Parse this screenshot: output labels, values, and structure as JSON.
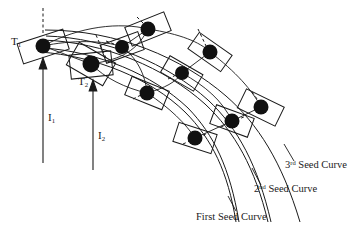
{
  "figure": {
    "name": "seed-curve-sampling-diagram",
    "background_color": "#ffffff",
    "stroke_color": "#1a1a1a",
    "dot_color": "#111111",
    "width": 361,
    "height": 232
  },
  "labels": {
    "t1": {
      "base": "T",
      "sub": "1"
    },
    "t2": {
      "base": "T",
      "sub": "2"
    },
    "i1": {
      "base": "I",
      "sub": "1"
    },
    "i2": {
      "base": "I",
      "sub": "2"
    },
    "curve3": {
      "num": "3",
      "ord": "rd",
      "text": " Seed Curve"
    },
    "curve2": {
      "num": "2",
      "ord": "nd",
      "text": " Seed Curve"
    },
    "curve1": {
      "text": "First Seed Curve"
    }
  },
  "diagram_data": {
    "type": "technical-diagram",
    "description": "Three nested seed curves with oriented rectangular sample boxes and solid sample dots, dashed tangent directions, and two upward direction arrows I1 and I2 pointing at sample points T1 and T2.",
    "seed_curves": [
      {
        "name": "First Seed Curve",
        "path": "M 40 52 C 95 56 150 78 185 112 C 212 139 228 172 236 222"
      },
      {
        "name": "2nd Seed Curve",
        "path": "M 42 40 C 105 42 165 68 205 104 C 235 132 255 168 268 222"
      },
      {
        "name": "3rd Seed Curve",
        "path": "M 45 30 C 118 30 182 58 226 96 C 258 124 282 162 300 222"
      }
    ],
    "sample_points": [
      {
        "id": "p1",
        "label": "T1",
        "cx": 43,
        "cy": 46,
        "r": 7.5,
        "box_angle": -18
      },
      {
        "id": "p2",
        "label": "T2",
        "cx": 91,
        "cy": 64,
        "r": 8.5,
        "box_angle": 30
      },
      {
        "id": "p3",
        "label": "",
        "cx": 148,
        "cy": 29,
        "r": 7.5,
        "box_angle": -22
      },
      {
        "id": "p4",
        "label": "",
        "cx": 122,
        "cy": 47,
        "r": 7.0,
        "box_angle": -20
      },
      {
        "id": "p5",
        "label": "",
        "cx": 210,
        "cy": 52,
        "r": 7.5,
        "box_angle": 35
      },
      {
        "id": "p6",
        "label": "",
        "cx": 182,
        "cy": 73,
        "r": 7.0,
        "box_angle": 30
      },
      {
        "id": "p7",
        "label": "",
        "cx": 147,
        "cy": 93,
        "r": 7.5,
        "box_angle": 22
      },
      {
        "id": "p8",
        "label": "",
        "cx": 261,
        "cy": 107,
        "r": 7.5,
        "box_angle": 26
      },
      {
        "id": "p9",
        "label": "",
        "cx": 232,
        "cy": 121,
        "r": 7.5,
        "box_angle": 20
      },
      {
        "id": "p10",
        "label": "",
        "cx": 195,
        "cy": 138,
        "r": 7.5,
        "box_angle": 18
      }
    ],
    "arrows": [
      {
        "id": "I1",
        "x": 43,
        "y_start": 163,
        "y_end": 62
      },
      {
        "id": "I2",
        "x": 93,
        "y_start": 170,
        "y_end": 84
      }
    ],
    "leader_lines": [
      {
        "for": "3rd Seed Curve",
        "from": [
          284,
          144
        ],
        "to": [
          294,
          160
        ]
      },
      {
        "for": "2nd Seed Curve",
        "from": [
          252,
          168
        ],
        "to": [
          261,
          184
        ]
      },
      {
        "for": "First Seed Curve",
        "from": [
          228,
          196
        ],
        "to": [
          236,
          210
        ]
      }
    ]
  }
}
